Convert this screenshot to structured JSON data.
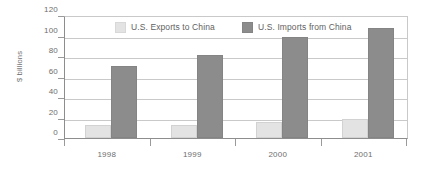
{
  "chart_data": {
    "type": "bar",
    "title": "",
    "subtitle": "",
    "xlabel": "",
    "ylabel": "$ billions",
    "categories": [
      "1998",
      "1999",
      "2000",
      "2001"
    ],
    "series": [
      {
        "name": "U.S. Exports to China",
        "color": "#e3e3e3",
        "values": [
          13,
          13,
          16,
          19
        ]
      },
      {
        "name": "U.S. Imports from China",
        "color": "#8c8c8c",
        "values": [
          71,
          82,
          100,
          109
        ]
      }
    ],
    "ylim": [
      0,
      120
    ],
    "yticks": [
      0,
      20,
      40,
      60,
      80,
      100,
      120
    ],
    "ytick_labels": [
      "0",
      "20",
      "40",
      "60",
      "80",
      "100",
      "120"
    ],
    "grid": true,
    "grid_axis": "y",
    "legend_position": "top-inside",
    "axis_color": "#8d8d8d",
    "grid_color": "#c9c9c9",
    "text_color": "#6e6e6e"
  }
}
